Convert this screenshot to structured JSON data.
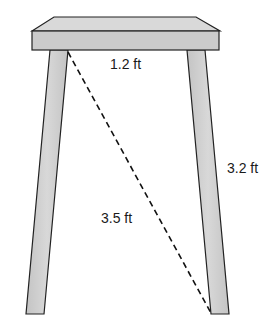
{
  "diagram": {
    "labels": {
      "top_width": "1.2 ft",
      "leg_height": "3.2 ft",
      "diagonal": "3.5 ft"
    },
    "colors": {
      "fill": "#cfcfcf",
      "stroke": "#222222",
      "background": "#ffffff"
    }
  }
}
